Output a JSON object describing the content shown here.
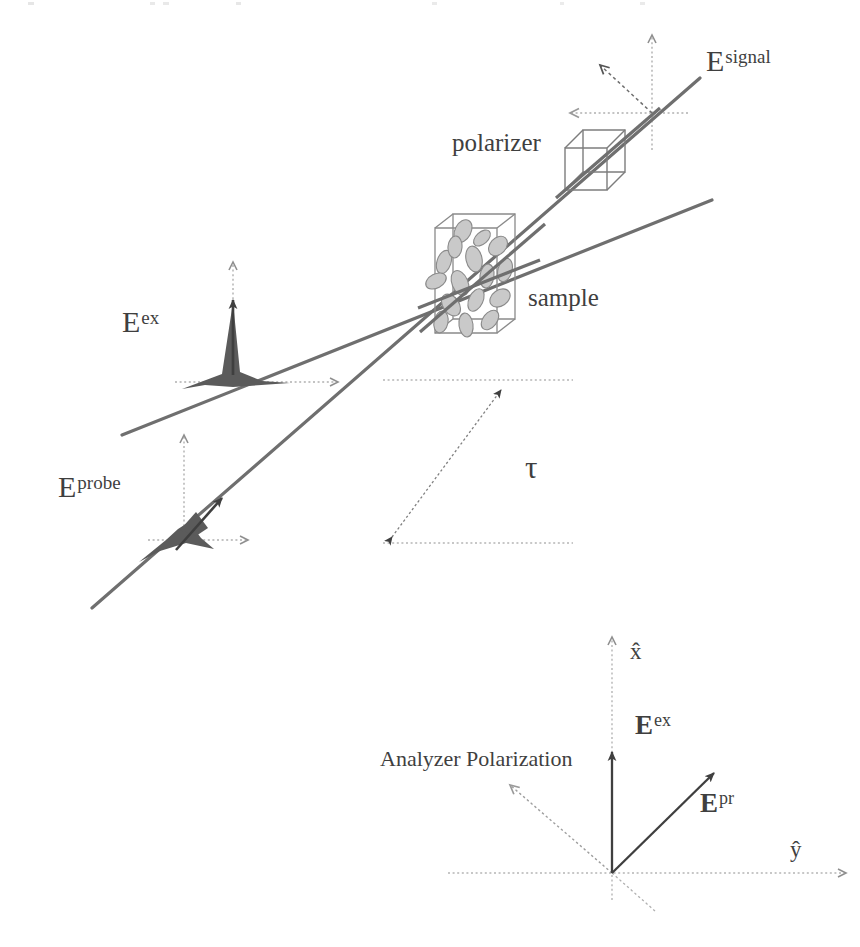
{
  "figure": {
    "kind": "optics-schematic",
    "background_color": "#ffffff",
    "ink_color": "#3f3f3f",
    "beam_color": "#6b6b6b",
    "dotted_color": "#a8a8a8",
    "molecule_fill": "#c9c9c9",
    "molecule_stroke": "#8a8a8a",
    "pulse_fill": "#5a5a5a"
  },
  "upper_panel": {
    "labels": {
      "e_signal": {
        "base": "E",
        "sup": "signal",
        "x": 706,
        "y": 46
      },
      "polarizer": {
        "text": "polarizer",
        "x": 452,
        "y": 130
      },
      "sample": {
        "text": "sample",
        "x": 528,
        "y": 285
      },
      "e_ex": {
        "base": "E",
        "sup": "ex",
        "x": 122,
        "y": 307
      },
      "e_probe": {
        "base": "E",
        "sup": "probe",
        "x": 58,
        "y": 472
      },
      "tau": {
        "text": "τ",
        "x": 525,
        "y": 452
      }
    },
    "beams": [
      {
        "name": "excitation-beam",
        "x1": 122,
        "y1": 435,
        "x2": 712,
        "y2": 200
      },
      {
        "name": "probe-beam",
        "x1": 92,
        "y1": 608,
        "x2": 700,
        "y2": 78
      }
    ],
    "sample_box": {
      "x": 435,
      "y": 220,
      "w": 62,
      "h": 105,
      "depth": 22,
      "molecule_count": 16
    },
    "polarizer_cube": {
      "x": 565,
      "y": 133,
      "w": 42,
      "h": 42,
      "depth": 18
    },
    "signal_axes": {
      "origin_x": 652,
      "origin_y": 113,
      "up_len": 78,
      "left_len": 82,
      "diag_angle_deg": 130
    },
    "ex_axes": {
      "origin_x": 233,
      "origin_y": 382,
      "up_len": 120,
      "right_len": 105
    },
    "probe_axes": {
      "origin_x": 184,
      "origin_y": 540,
      "up_len": 105,
      "right_len": 100
    },
    "tau_marker": {
      "top_line_y": 380,
      "top_line_x1": 383,
      "top_line_x2": 573,
      "bottom_line_y": 543,
      "bottom_line_x1": 383,
      "bottom_line_x2": 573,
      "arrow_x1": 390,
      "arrow_y1": 538,
      "arrow_x2": 503,
      "arrow_y2": 388
    }
  },
  "lower_panel": {
    "labels": {
      "x_hat": {
        "text": "x̂",
        "x": 630,
        "y": 640
      },
      "y_hat": {
        "text": "ŷ",
        "x": 790,
        "y": 838
      },
      "e_ex": {
        "base": "E",
        "sup": "ex",
        "x": 635,
        "y": 712
      },
      "e_pr": {
        "base": "E",
        "sup": "pr",
        "x": 700,
        "y": 790
      },
      "analyzer": {
        "text": "Analyzer Polarization",
        "x": 380,
        "y": 748
      }
    },
    "origin": {
      "x": 612,
      "y": 873
    },
    "axes": {
      "x_axis": {
        "x1": 612,
        "y1": 873,
        "x2": 612,
        "y2": 637,
        "name": "x-hat-axis"
      },
      "y_axis": {
        "x1": 448,
        "y1": 873,
        "x2": 846,
        "y2": 873,
        "name": "y-hat-axis"
      }
    },
    "vectors": [
      {
        "name": "e-ex-vector",
        "x1": 612,
        "y1": 873,
        "x2": 612,
        "y2": 748,
        "style": "solid"
      },
      {
        "name": "e-pr-vector",
        "x1": 612,
        "y1": 873,
        "x2": 712,
        "y2": 775,
        "style": "solid"
      },
      {
        "name": "analyzer-polarization-line",
        "x1": 651,
        "y1": 908,
        "x2": 508,
        "y2": 783,
        "style": "dotted-arrow"
      }
    ]
  },
  "molecules": [
    {
      "cx": 463,
      "cy": 231,
      "rx": 8,
      "ry": 12,
      "rot": 28
    },
    {
      "cx": 444,
      "cy": 262,
      "rx": 7,
      "ry": 12,
      "rot": 18
    },
    {
      "cx": 474,
      "cy": 259,
      "rx": 8,
      "ry": 13,
      "rot": -12
    },
    {
      "cx": 498,
      "cy": 246,
      "rx": 8,
      "ry": 11,
      "rot": 42
    },
    {
      "cx": 436,
      "cy": 281,
      "rx": 7,
      "ry": 11,
      "rot": 62
    },
    {
      "cx": 460,
      "cy": 283,
      "rx": 8,
      "ry": 13,
      "rot": -22
    },
    {
      "cx": 487,
      "cy": 276,
      "rx": 7,
      "ry": 12,
      "rot": 8
    },
    {
      "cx": 505,
      "cy": 270,
      "rx": 7,
      "ry": 12,
      "rot": 15
    },
    {
      "cx": 451,
      "cy": 305,
      "rx": 8,
      "ry": 12,
      "rot": -35
    },
    {
      "cx": 476,
      "cy": 300,
      "rx": 7,
      "ry": 12,
      "rot": 25
    },
    {
      "cx": 500,
      "cy": 298,
      "rx": 8,
      "ry": 11,
      "rot": 55
    },
    {
      "cx": 441,
      "cy": 322,
      "rx": 7,
      "ry": 11,
      "rot": 12
    },
    {
      "cx": 466,
      "cy": 325,
      "rx": 7,
      "ry": 12,
      "rot": -8
    },
    {
      "cx": 490,
      "cy": 320,
      "rx": 7,
      "ry": 11,
      "rot": 38
    },
    {
      "cx": 455,
      "cy": 247,
      "rx": 7,
      "ry": 11,
      "rot": 5
    },
    {
      "cx": 482,
      "cy": 238,
      "rx": 6,
      "ry": 10,
      "rot": 48
    }
  ]
}
